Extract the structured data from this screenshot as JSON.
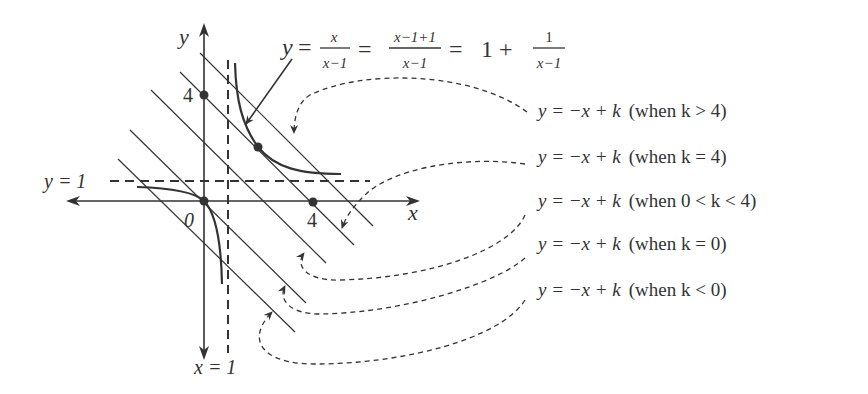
{
  "diagram": {
    "formula": {
      "lhs": "y",
      "frac1_num": "x",
      "frac1_den": "x−1",
      "frac2_num": "x−1+1",
      "frac2_den": "x−1",
      "rhs_whole": "1 +",
      "frac3_num": "1",
      "frac3_den": "x−1"
    },
    "axes": {
      "x_label": "x",
      "y_label": "y",
      "origin_label": "0",
      "x_tick_label": "4",
      "y_tick_label": "4"
    },
    "asymptotes": {
      "horizontal_label": "y = 1",
      "vertical_label": "x = 1"
    },
    "legend": [
      {
        "equation": "y = −x + k",
        "condition": "(when k > 4)"
      },
      {
        "equation": "y = −x + k",
        "condition": "(when k = 4)"
      },
      {
        "equation": "y = −x + k",
        "condition": "(when 0 < k < 4)"
      },
      {
        "equation": "y = −x + k",
        "condition": "(when k = 0)"
      },
      {
        "equation": "y = −x + k",
        "condition": "(when k < 0)"
      }
    ],
    "colors": {
      "ink": "#333333",
      "background": "#ffffff"
    }
  }
}
